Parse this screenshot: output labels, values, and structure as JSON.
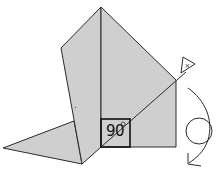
{
  "diagram": {
    "type": "geometry-rotation",
    "angle_label": "90",
    "degree_symbol": "°",
    "center_marker_label": "×",
    "rotation_arrow": "clockwise-circular-arrow",
    "colors": {
      "fill": "#cfcfcf",
      "stroke": "#2a2a2a",
      "background": "#ffffff"
    }
  }
}
